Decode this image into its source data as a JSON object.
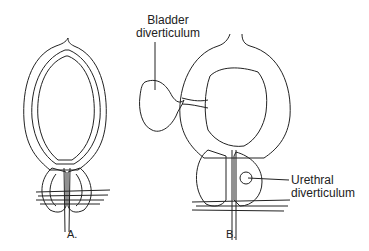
{
  "labels": {
    "bladder_line1": "Bladder",
    "bladder_line2": "diverticulum",
    "urethral_line1": "Urethral",
    "urethral_line2": "diverticulum",
    "panel_a": "A.",
    "panel_b": "B."
  },
  "colors": {
    "line": "#222222",
    "background": "#ffffff"
  }
}
